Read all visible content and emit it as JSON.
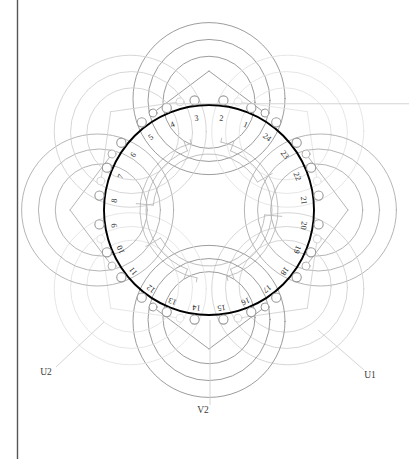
{
  "figure": {
    "type": "motor-stator-winding-diagram",
    "slot_count": 24,
    "border": {
      "left_rule_x": 17,
      "color": "#555555"
    }
  },
  "colors": {
    "stator_ring": "#000000",
    "slot_number_text": "#2b2b2b",
    "terminal_text": "#3a3a3a",
    "coil_group_dark": "#8a8a8a",
    "coil_group_mid": "#a8a8a8",
    "coil_group_light": "#cfcfcf",
    "coil_group_faint": "#e2e2e2",
    "node_stroke": "#9a9a9a",
    "node_fill": "#ffffff",
    "inner_arc": "#b5b5b5",
    "background": "#ffffff"
  },
  "geometry": {
    "center_x": 209,
    "center_y": 210,
    "stator_outer_radius": 105,
    "stator_inner_radius": 72,
    "node_radius": 4.6,
    "slot_label_radius": 93,
    "slot_angle_step": 15,
    "slot_one_angle_deg": 67.5
  },
  "slots": [
    {
      "number": "1"
    },
    {
      "number": "2"
    },
    {
      "number": "3"
    },
    {
      "number": "4"
    },
    {
      "number": "5"
    },
    {
      "number": "6"
    },
    {
      "number": "7"
    },
    {
      "number": "8"
    },
    {
      "number": "9"
    },
    {
      "number": "10"
    },
    {
      "number": "11"
    },
    {
      "number": "12"
    },
    {
      "number": "13"
    },
    {
      "number": "14"
    },
    {
      "number": "15"
    },
    {
      "number": "16"
    },
    {
      "number": "17"
    },
    {
      "number": "18"
    },
    {
      "number": "19"
    },
    {
      "number": "20"
    },
    {
      "number": "21"
    },
    {
      "number": "22"
    },
    {
      "number": "23"
    },
    {
      "number": "24"
    }
  ],
  "terminals": [
    {
      "id": "U1",
      "label": "U1",
      "x": 370,
      "y": 378,
      "lead_from_x": 318,
      "lead_from_y": 330
    },
    {
      "id": "U2",
      "label": "U2",
      "x": 46,
      "y": 375,
      "lead_from_x": 104,
      "lead_from_y": 322
    },
    {
      "id": "V2",
      "label": "V2",
      "x": 203,
      "y": 413,
      "lead_from_x": 210,
      "lead_from_y": 320
    }
  ],
  "chart_data": {
    "type": "diagram",
    "title": "",
    "slot_numbers": [
      "1",
      "2",
      "3",
      "4",
      "5",
      "6",
      "7",
      "8",
      "9",
      "10",
      "11",
      "12",
      "13",
      "14",
      "15",
      "16",
      "17",
      "18",
      "19",
      "20",
      "21",
      "22",
      "23",
      "24"
    ],
    "terminal_labels": [
      "U1",
      "U2",
      "V2"
    ],
    "coil_span_slots": 5,
    "coil_group_count": 8
  }
}
